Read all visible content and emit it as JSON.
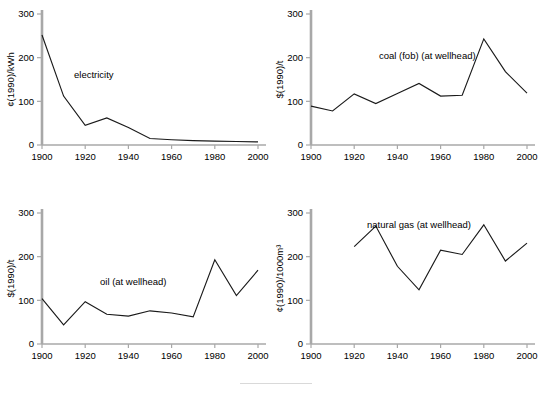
{
  "figure": {
    "name": "energy-price-history-panels",
    "background_color": "#ffffff",
    "axis_color": "#a8a8a8",
    "line_color": "#1a1a1a"
  },
  "caption_rule": {
    "visible": true,
    "color": "#d9d9d9"
  },
  "chart_data": [
    {
      "type": "line",
      "panel": "top-left",
      "title": "",
      "series_label": "electricity",
      "xlabel": "",
      "ylabel": "¢(1990)/kWh",
      "xlim": [
        1900,
        2000
      ],
      "ylim": [
        0,
        300
      ],
      "xticks": [
        1900,
        1920,
        1940,
        1960,
        1980,
        2000
      ],
      "xtick_labels": [
        "1900",
        "1920",
        "1940",
        "1960",
        "1980",
        "2000"
      ],
      "yticks": [
        0,
        100,
        200,
        300
      ],
      "ytick_labels": [
        "0",
        "100",
        "200",
        "300"
      ],
      "grid": false,
      "legend_position": "inside-upper-left",
      "x": [
        1900,
        1910,
        1920,
        1930,
        1940,
        1950,
        1960,
        1970,
        1980,
        1990,
        2000
      ],
      "values": [
        252,
        112,
        45,
        62,
        40,
        15,
        12,
        10,
        9,
        8,
        7
      ]
    },
    {
      "type": "line",
      "panel": "top-right",
      "title": "",
      "series_label": "coal (fob) (at wellhead)",
      "xlabel": "",
      "ylabel": "$(1990)/t",
      "xlim": [
        1900,
        2000
      ],
      "ylim": [
        0,
        300
      ],
      "xticks": [
        1900,
        1920,
        1940,
        1960,
        1980,
        2000
      ],
      "xtick_labels": [
        "1900",
        "1920",
        "1940",
        "1960",
        "1980",
        "2000"
      ],
      "yticks": [
        0,
        100,
        200,
        300
      ],
      "ytick_labels": [
        "0",
        "100",
        "200",
        "300"
      ],
      "grid": false,
      "legend_position": "inside-upper-center",
      "x": [
        1900,
        1910,
        1920,
        1930,
        1940,
        1950,
        1960,
        1970,
        1980,
        1990,
        2000
      ],
      "values": [
        89,
        78,
        117,
        95,
        118,
        141,
        112,
        114,
        243,
        168,
        119
      ]
    },
    {
      "type": "line",
      "panel": "bottom-left",
      "title": "",
      "series_label": "oil (at wellhead)",
      "xlabel": "",
      "ylabel": "$(1990)/t",
      "xlim": [
        1900,
        2000
      ],
      "ylim": [
        0,
        300
      ],
      "xticks": [
        1900,
        1920,
        1940,
        1960,
        1980,
        2000
      ],
      "xtick_labels": [
        "1900",
        "1920",
        "1940",
        "1960",
        "1980",
        "2000"
      ],
      "yticks": [
        0,
        100,
        200,
        300
      ],
      "ytick_labels": [
        "0",
        "100",
        "200",
        "300"
      ],
      "grid": false,
      "legend_position": "inside-center",
      "x": [
        1900,
        1910,
        1920,
        1930,
        1940,
        1950,
        1960,
        1970,
        1980,
        1990,
        2000
      ],
      "values": [
        104,
        44,
        97,
        68,
        64,
        76,
        71,
        62,
        193,
        111,
        169
      ]
    },
    {
      "type": "line",
      "panel": "bottom-right",
      "title": "",
      "series_label": "natural gas (at wellhead)",
      "xlabel": "",
      "ylabel": "¢(1990)/1000m³",
      "xlim": [
        1900,
        2000
      ],
      "ylim": [
        0,
        300
      ],
      "xticks": [
        1900,
        1920,
        1940,
        1960,
        1980,
        2000
      ],
      "xtick_labels": [
        "1900",
        "1920",
        "1940",
        "1960",
        "1980",
        "2000"
      ],
      "yticks": [
        0,
        100,
        200,
        300
      ],
      "ytick_labels": [
        "0",
        "100",
        "200",
        "300"
      ],
      "grid": false,
      "legend_position": "inside-upper-center",
      "x": [
        1920,
        1930,
        1940,
        1950,
        1960,
        1970,
        1980,
        1990,
        2000
      ],
      "values": [
        223,
        270,
        178,
        124,
        215,
        205,
        273,
        190,
        231
      ]
    }
  ]
}
